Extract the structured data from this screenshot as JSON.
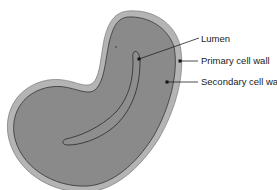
{
  "diagram": {
    "labels": [
      {
        "id": "lumen",
        "text": "Lumen"
      },
      {
        "id": "primary",
        "text": "Primary cell wall"
      },
      {
        "id": "secondary",
        "text": "Secondary cell wall"
      }
    ],
    "colors": {
      "primary_wall": "#b4b4b4",
      "secondary_wall": "#8a8a8a",
      "outline": "#333333",
      "leader": "#222222",
      "background": "#ffffff"
    }
  }
}
